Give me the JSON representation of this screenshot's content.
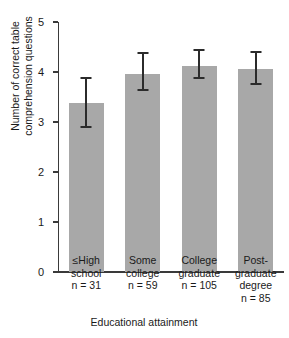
{
  "chart_data": {
    "type": "bar",
    "title": "",
    "xlabel": "Educational attainment",
    "ylabel": "Number of correct table\ncomprehension questions",
    "ylim": [
      0,
      5
    ],
    "yticks": [
      "0",
      "1",
      "2",
      "3",
      "4",
      "5"
    ],
    "grid": false,
    "legend": null,
    "categories": [
      "≤High\nschool",
      "Some\ncollege",
      "College\ngraduate",
      "Post-graduate\ndegree"
    ],
    "category_sublabels": [
      "n = 31",
      "n = 59",
      "n = 105",
      "n = 85"
    ],
    "group_sizes": [
      31,
      59,
      105,
      85
    ],
    "values": [
      3.38,
      3.96,
      4.13,
      4.06
    ],
    "error_upper": [
      3.88,
      4.38,
      4.44,
      4.4
    ],
    "error_lower": [
      2.9,
      3.64,
      3.88,
      3.76
    ],
    "bar_color": "#a8a8a8",
    "error_color": "#2b2b2b",
    "axis_color": "#3a3a3a"
  }
}
